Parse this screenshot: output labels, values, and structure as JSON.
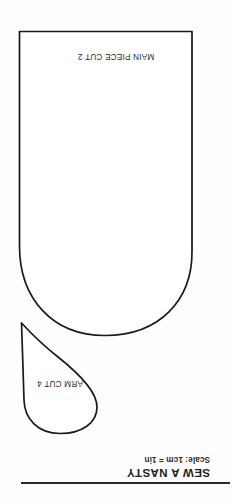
{
  "document": {
    "type": "sewing-pattern-sheet",
    "orientation": "upside-down",
    "background_color": "#fefefe",
    "ink_color": "#1a1a1a",
    "width": 235,
    "height": 502
  },
  "pieces": [
    {
      "id": "main-piece",
      "label": "MAIN PIECE CUT 2",
      "shape": "rounded-bottom rectangle",
      "cut_quantity": 2
    },
    {
      "id": "arm-piece",
      "label": "ARM CUT 4",
      "shape": "teardrop / leaf",
      "cut_quantity": 4
    }
  ],
  "footer": {
    "brand": "SEW A NASTY",
    "scale": "Scale: 1cm = 1in"
  }
}
